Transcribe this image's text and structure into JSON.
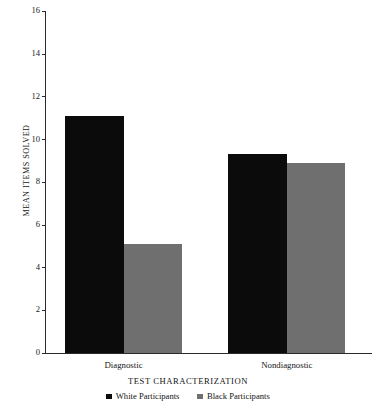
{
  "chart_data": {
    "type": "bar",
    "title": "",
    "xlabel": "TEST CHARACTERIZATION",
    "ylabel": "MEAN ITEMS SOLVED",
    "categories": [
      "Diagnostic",
      "Nondiagnostic"
    ],
    "series": [
      {
        "name": "White Participants",
        "color": "#0b0b0b",
        "values": [
          11.1,
          9.3
        ]
      },
      {
        "name": "Black Participants",
        "color": "#706f6f",
        "values": [
          5.1,
          8.9
        ]
      }
    ],
    "ylim": [
      0,
      16
    ],
    "yticks": [
      0,
      2,
      4,
      6,
      8,
      10,
      12,
      14,
      16
    ],
    "ytick_labels": [
      "0",
      "2",
      "4",
      "6",
      "8",
      "10",
      "12",
      "14",
      "16"
    ],
    "grid": false,
    "legend_position": "bottom"
  },
  "legend": {
    "items": [
      {
        "label": "White Participants",
        "swatch": "black-square-icon"
      },
      {
        "label": "Black Participants",
        "swatch": "gray-square-icon"
      }
    ]
  },
  "axes": {
    "y_title": "MEAN ITEMS SOLVED",
    "x_title": "TEST CHARACTERIZATION"
  }
}
